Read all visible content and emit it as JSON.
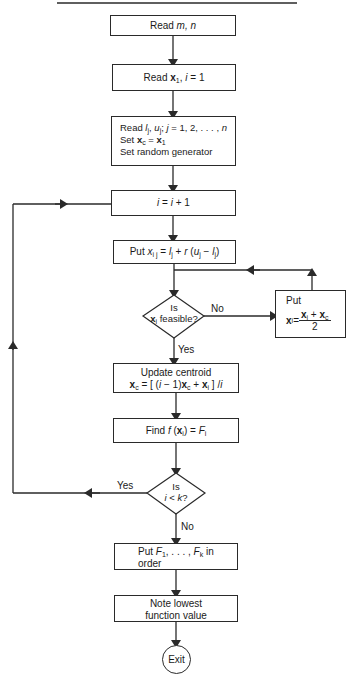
{
  "diagram": {
    "type": "flowchart",
    "nodes": {
      "read_mn": {
        "text": "Read m, n",
        "parts": {
          "prefix": "Read ",
          "vars": "m, n"
        }
      },
      "read_x1": {
        "text": "Read x1, i = 1",
        "parts": {
          "prefix": "Read ",
          "var": "x",
          "sub": "1",
          "rest": ", ",
          "i": "i",
          "eq": " = 1"
        }
      },
      "init": {
        "line1": {
          "prefix": "Read ",
          "l": "l",
          "lsub": "j",
          "u": "u",
          "usub": "j",
          "sep": "; ",
          "j": "j",
          "range": " = 1, 2, . . . , ",
          "n": "n"
        },
        "line2": {
          "prefix": "Set ",
          "x": "x",
          "xsub": "c",
          "eq": " = ",
          "x1": "x",
          "x1sub": "1"
        },
        "line3": "Set random generator"
      },
      "increment": {
        "i": "i",
        "eq": " = ",
        "i2": "i",
        "plus": " + 1"
      },
      "put_x": {
        "prefix": "Put ",
        "x": "x",
        "xsub": "i j",
        "eq": " = ",
        "l": "l",
        "lsub": "j",
        "plus": " + ",
        "r": "r",
        "paren": " (",
        "u": "u",
        "usub": "j",
        "minus": " − ",
        "l2": "l",
        "l2sub": "j",
        "close": ")"
      },
      "feasible_decision": {
        "line1": "Is",
        "x": "x",
        "xsub": "i",
        "line2": " feasible?"
      },
      "put_midpoint": {
        "title": "Put",
        "lhs": "x",
        "lhssub": "i",
        "eq": " = ",
        "num_a": "x",
        "num_asub": "i",
        "num_plus": " + ",
        "num_b": "x",
        "num_bsub": "c",
        "den": "2"
      },
      "update_centroid": {
        "line1": "Update centroid",
        "xc": "x",
        "xcsub": "c",
        "eq": " = [ (",
        "i": "i",
        "minus": " − 1)",
        "xc2": "x",
        "xc2sub": "c",
        "plus": " + ",
        "xi": "x",
        "xisub": "i",
        "close": " ] /",
        "i2": "i"
      },
      "find_f": {
        "prefix": "Find ",
        "f": "f",
        "paren": " (",
        "x": "x",
        "xsub": "i",
        "close": ") = ",
        "F": "F",
        "Fsub": "i"
      },
      "k_decision": {
        "line1": "Is",
        "i": "i",
        "lt": " < ",
        "k": "k",
        "q": "?"
      },
      "order": {
        "prefix": "Put ",
        "F1": "F",
        "F1sub": "1",
        "dots": ", . . . , ",
        "Fk": "F",
        "Fksub": "k",
        "in": " in",
        "line2": "order"
      },
      "note_lowest": {
        "line1": "Note lowest",
        "line2": "function value"
      },
      "exit": {
        "text": "Exit"
      }
    },
    "edge_labels": {
      "feasible_no": "No",
      "feasible_yes": "Yes",
      "k_yes": "Yes",
      "k_no": "No"
    },
    "colors": {
      "stroke": "#2a2a2a",
      "background": "#ffffff",
      "text": "#1a1a1a"
    }
  }
}
